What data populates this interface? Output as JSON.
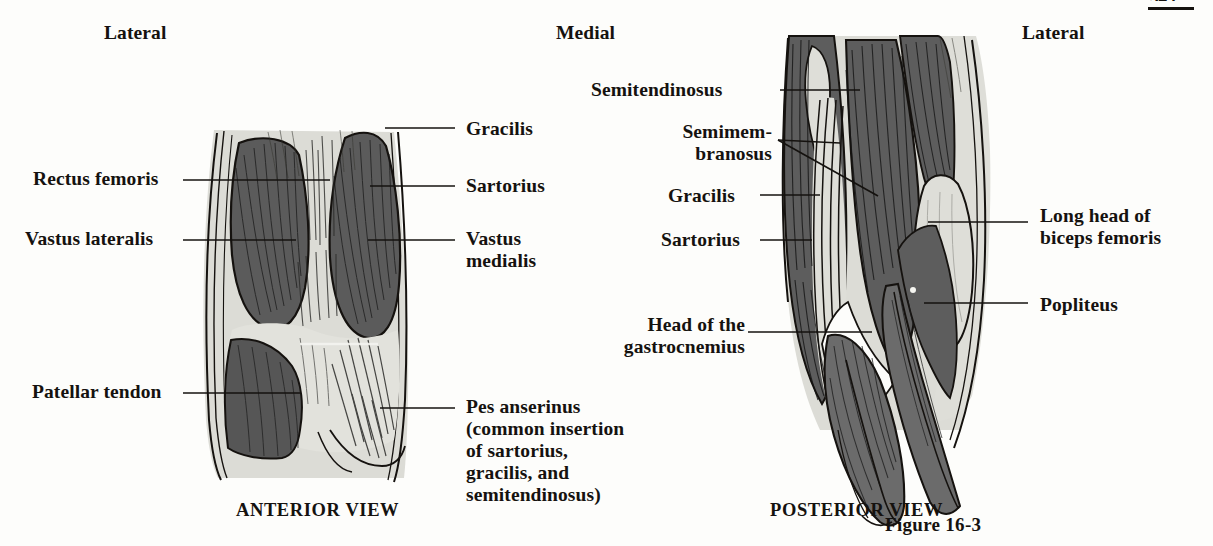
{
  "figure": {
    "number": "Figure 16-3",
    "page_number": "349",
    "orientation_labels": [
      {
        "name": "lateral-left",
        "text": "Lateral",
        "x": 104,
        "y": 22
      },
      {
        "name": "medial",
        "text": "Medial",
        "x": 556,
        "y": 22
      },
      {
        "name": "lateral-right",
        "text": "Lateral",
        "x": 1022,
        "y": 22
      }
    ],
    "views": [
      {
        "id": "anterior",
        "caption": "ANTERIOR VIEW",
        "caption_x": 236,
        "caption_y": 500
      },
      {
        "id": "posterior",
        "caption": "POSTERIOR VIEW",
        "caption_x": 770,
        "caption_y": 500
      }
    ]
  },
  "anterior_view": {
    "labels_left": [
      {
        "name": "rectus-femoris",
        "text": "Rectus femoris",
        "x": 33,
        "y": 168
      },
      {
        "name": "vastus-lateralis",
        "text": "Vastus lateralis",
        "x": 25,
        "y": 228
      },
      {
        "name": "patellar-tendon",
        "text": "Patellar tendon",
        "x": 32,
        "y": 381
      }
    ],
    "labels_right": [
      {
        "name": "gracilis",
        "text": "Gracilis",
        "x": 466,
        "y": 118
      },
      {
        "name": "sartorius",
        "text": "Sartorius",
        "x": 466,
        "y": 175
      },
      {
        "name": "vastus-medialis",
        "text": "Vastus\nmedialis",
        "x": 466,
        "y": 228
      },
      {
        "name": "pes-anserinus",
        "text": "Pes anserinus\n(common insertion\nof sartorius,\ngracilis, and\nsemitendinosus)",
        "x": 466,
        "y": 396
      }
    ]
  },
  "posterior_view": {
    "labels_left": [
      {
        "name": "semitendinosus",
        "text": "Semitendinosus",
        "x": 591,
        "y": 79
      },
      {
        "name": "semimembranosus",
        "text": "Semimem-\nbranosus",
        "x": 646,
        "y": 121
      },
      {
        "name": "gracilis",
        "text": "Gracilis",
        "x": 668,
        "y": 185
      },
      {
        "name": "sartorius",
        "text": "Sartorius",
        "x": 661,
        "y": 229
      },
      {
        "name": "head-of-gastrocnemius",
        "text": "Head of the\ngastrocnemius",
        "x": 613,
        "y": 314
      }
    ],
    "labels_right": [
      {
        "name": "long-head-biceps-femoris",
        "text": "Long head of\nbiceps femoris",
        "x": 1040,
        "y": 205
      },
      {
        "name": "popliteus",
        "text": "Popliteus",
        "x": 1040,
        "y": 294
      }
    ]
  },
  "colors": {
    "background": "#fdfdfb",
    "ink": "#15120f",
    "muscle_dark": "#5d5d5d",
    "muscle_light": "#d9d9d4",
    "muscle_mid": "#8a8a86",
    "outline": "#15120f"
  }
}
